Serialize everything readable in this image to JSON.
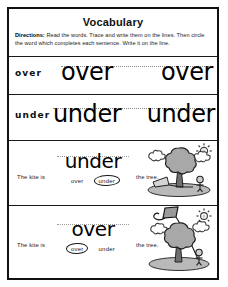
{
  "worksheet": {
    "title": "Vocabulary",
    "directions_label": "Directions:",
    "directions_text": " Read the words. Trace and write them on the lines. Then circle the word which completes each sentence. Write it on the line.",
    "ink_color": "#111111",
    "paper_color": "#ffffff"
  },
  "trace_rows": [
    {
      "label": "over",
      "trace_word_1": "over",
      "trace_word_2": "over"
    },
    {
      "label": "under",
      "trace_word_1": "under",
      "trace_word_2": "under"
    }
  ],
  "sentences": [
    {
      "lead_text": "The kite is",
      "tail_text": "the tree.",
      "answer_written": "under",
      "choice_1": "over",
      "choice_2": "under",
      "circled_choice": "under",
      "illustration": "kite-under-tree-illustration"
    },
    {
      "lead_text": "The kite is",
      "tail_text": "the tree.",
      "answer_written": "over",
      "choice_1": "over",
      "choice_2": "under",
      "circled_choice": "over",
      "illustration": "kite-over-tree-illustration"
    }
  ]
}
